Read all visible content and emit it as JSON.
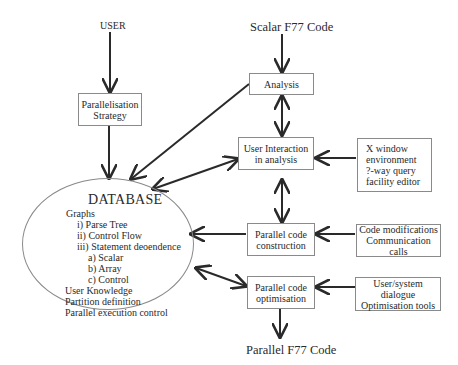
{
  "inputs": {
    "user": "USER",
    "scalar_code": "Scalar F77 Code"
  },
  "output": {
    "parallel_code": "Parallel F77 Code"
  },
  "boxes": {
    "strategy": [
      "Parallelisation",
      "Strategy"
    ],
    "analysis": [
      "Analysis"
    ],
    "user_interaction": [
      "User Interaction",
      "in analysis"
    ],
    "construction": [
      "Parallel code",
      "construction"
    ],
    "optimisation": [
      "Parallel code",
      "optimisation"
    ]
  },
  "tools": {
    "xwindow": [
      "X window",
      "environment",
      "?-way query",
      "facility editor"
    ],
    "code_mods": [
      "Code modifications",
      "Communication calls"
    ],
    "dialogue": [
      "User/system dialogue",
      "Optimisation tools"
    ]
  },
  "database": {
    "title": "DATABASE",
    "lines": [
      "Graphs",
      "i) Parse Tree",
      "ii) Control Flow",
      "iii) Statement deoendence",
      "a) Scalar",
      "b) Array",
      "c) Control",
      "User Knowledge",
      "Partition definition",
      "Parallel execution control"
    ]
  },
  "colors": {
    "line": "#2a2a2a",
    "border": "#8a8a8a"
  }
}
